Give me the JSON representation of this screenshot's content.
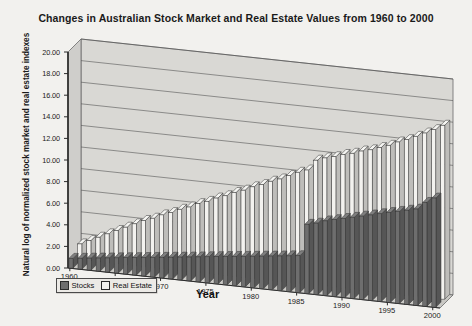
{
  "chart_data": {
    "type": "bar",
    "title": "Changes in Australian Stock Market and Real Estate Values from 1960 to 2000",
    "xlabel": "Year",
    "ylabel": "Natural log of normalized stock market and real estate indexes",
    "ylim": [
      0.0,
      20.0
    ],
    "ytick_step": 2.0,
    "ytick_labels": [
      "0.00",
      "2.00",
      "4.00",
      "6.00",
      "8.00",
      "10.00",
      "12.00",
      "14.00",
      "16.00",
      "18.00",
      "20.00"
    ],
    "ytick_values": [
      0,
      2,
      4,
      6,
      8,
      10,
      12,
      14,
      16,
      18,
      20
    ],
    "xtick_labels": [
      "1960",
      "1965",
      "1970",
      "1975",
      "1980",
      "1985",
      "1990",
      "1995",
      "2000"
    ],
    "xtick_values": [
      1960,
      1965,
      1970,
      1975,
      1980,
      1985,
      1990,
      1995,
      2000
    ],
    "categories": [
      1960,
      1961,
      1962,
      1963,
      1964,
      1965,
      1966,
      1967,
      1968,
      1969,
      1970,
      1971,
      1972,
      1973,
      1974,
      1975,
      1976,
      1977,
      1978,
      1979,
      1980,
      1981,
      1982,
      1983,
      1984,
      1985,
      1986,
      1987,
      1988,
      1989,
      1990,
      1991,
      1992,
      1993,
      1994,
      1995,
      1996,
      1997,
      1998,
      1999,
      2000
    ],
    "grid": true,
    "grid_axis": "y",
    "legend_position": "bottom-left",
    "projection": "3d-column",
    "series": [
      {
        "name": "Stocks",
        "color": "#6e6e6e",
        "values": [
          0.9,
          1.0,
          1.1,
          1.2,
          1.3,
          1.4,
          1.5,
          1.6,
          1.7,
          1.8,
          1.9,
          2.0,
          2.1,
          2.2,
          2.3,
          2.4,
          2.5,
          2.6,
          2.7,
          2.8,
          2.9,
          3.0,
          3.1,
          3.2,
          3.3,
          3.4,
          6.4,
          6.6,
          6.9,
          7.1,
          7.3,
          7.5,
          7.7,
          7.9,
          8.1,
          8.3,
          8.5,
          8.7,
          8.9,
          9.6,
          10.1
        ]
      },
      {
        "name": "Real Estate",
        "color": "#f3f2ef",
        "values": [
          1.5,
          1.9,
          2.3,
          2.7,
          3.1,
          3.5,
          3.9,
          4.3,
          4.6,
          5.0,
          5.3,
          5.7,
          6.0,
          6.4,
          6.7,
          7.1,
          7.4,
          7.8,
          8.1,
          8.5,
          8.8,
          9.2,
          9.5,
          9.9,
          10.3,
          10.6,
          11.6,
          11.9,
          12.1,
          12.4,
          12.6,
          12.9,
          13.1,
          13.4,
          13.7,
          14.1,
          14.4,
          14.8,
          15.2,
          15.6,
          16.1
        ]
      }
    ]
  },
  "legend": {
    "items": [
      {
        "label": "Stocks",
        "swatch": "dark-gray"
      },
      {
        "label": "Real Estate",
        "swatch": "white"
      }
    ]
  },
  "colors": {
    "background": "#f2f1ee",
    "wall": "#d9d8d4",
    "floor": "#c9c8c4",
    "stocks": "#6e6e6e",
    "real_estate": "#f3f2ef",
    "axis": "#2b2b2b",
    "grid": "#555555"
  }
}
